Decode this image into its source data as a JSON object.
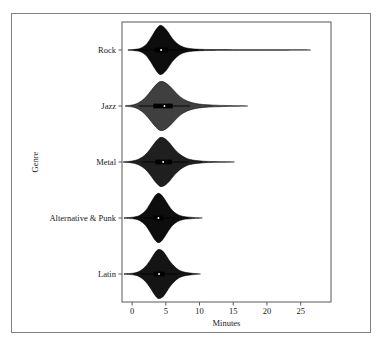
{
  "figure": {
    "background_color": "#ffffff",
    "frame_color": "#808080",
    "axis_color": "#595959"
  },
  "chart_data": {
    "type": "violin",
    "title": "",
    "subtitle": "",
    "xlabel": "Minutes",
    "ylabel": "Genre",
    "orientation": "horizontal",
    "grid": false,
    "legend": null,
    "xlim": [
      -1.5,
      29.5
    ],
    "xticks": [
      0,
      5,
      10,
      15,
      20,
      25
    ],
    "xticklabels": [
      "0",
      "5",
      "10",
      "15",
      "20",
      "25"
    ],
    "categories": [
      "Rock",
      "Jazz",
      "Metal",
      "Alternative & Punk",
      "Latin"
    ],
    "fill_colors": [
      "#0d0d0d",
      "#3f3f3f",
      "#1f1f1f",
      "#0d0d0d",
      "#141414"
    ],
    "series": [
      {
        "name": "Rock",
        "median": 4.3,
        "q1": 3.4,
        "q3": 5.3,
        "whisker_low": 0.2,
        "whisker_high": 8.0,
        "min": -0.6,
        "max": 26.1,
        "peak": 4.2,
        "peak_width": 1.0,
        "density": [
          {
            "x": -0.6,
            "d": 0.01
          },
          {
            "x": 0.5,
            "d": 0.03
          },
          {
            "x": 1.2,
            "d": 0.07
          },
          {
            "x": 2.0,
            "d": 0.2
          },
          {
            "x": 2.7,
            "d": 0.46
          },
          {
            "x": 3.3,
            "d": 0.73
          },
          {
            "x": 3.8,
            "d": 0.92
          },
          {
            "x": 4.2,
            "d": 1.0
          },
          {
            "x": 4.7,
            "d": 0.93
          },
          {
            "x": 5.3,
            "d": 0.74
          },
          {
            "x": 6.0,
            "d": 0.46
          },
          {
            "x": 6.8,
            "d": 0.24
          },
          {
            "x": 7.6,
            "d": 0.12
          },
          {
            "x": 8.6,
            "d": 0.06
          },
          {
            "x": 10.0,
            "d": 0.03
          },
          {
            "x": 12.0,
            "d": 0.02
          },
          {
            "x": 15.0,
            "d": 0.015
          },
          {
            "x": 19.0,
            "d": 0.012
          },
          {
            "x": 23.0,
            "d": 0.01
          },
          {
            "x": 26.1,
            "d": 0.005
          }
        ]
      },
      {
        "name": "Jazz",
        "median": 4.8,
        "q1": 3.2,
        "q3": 6.0,
        "whisker_low": 1.0,
        "whisker_high": 8.6,
        "min": -1.0,
        "max": 16.8,
        "peak": 4.3,
        "peak_width": 1.0,
        "density": [
          {
            "x": -1.0,
            "d": 0.01
          },
          {
            "x": 0.2,
            "d": 0.05
          },
          {
            "x": 1.0,
            "d": 0.14
          },
          {
            "x": 1.8,
            "d": 0.3
          },
          {
            "x": 2.5,
            "d": 0.52
          },
          {
            "x": 3.2,
            "d": 0.76
          },
          {
            "x": 3.8,
            "d": 0.93
          },
          {
            "x": 4.3,
            "d": 1.0
          },
          {
            "x": 4.9,
            "d": 0.95
          },
          {
            "x": 5.6,
            "d": 0.8
          },
          {
            "x": 6.4,
            "d": 0.57
          },
          {
            "x": 7.2,
            "d": 0.36
          },
          {
            "x": 8.2,
            "d": 0.2
          },
          {
            "x": 9.3,
            "d": 0.11
          },
          {
            "x": 10.6,
            "d": 0.06
          },
          {
            "x": 12.2,
            "d": 0.035
          },
          {
            "x": 14.0,
            "d": 0.02
          },
          {
            "x": 16.8,
            "d": 0.004
          }
        ]
      },
      {
        "name": "Metal",
        "median": 4.6,
        "q1": 3.5,
        "q3": 5.9,
        "whisker_low": 1.4,
        "whisker_high": 8.4,
        "min": -1.3,
        "max": 14.8,
        "peak": 4.3,
        "peak_width": 1.0,
        "density": [
          {
            "x": -1.3,
            "d": 0.01
          },
          {
            "x": 0.0,
            "d": 0.04
          },
          {
            "x": 1.0,
            "d": 0.12
          },
          {
            "x": 1.9,
            "d": 0.28
          },
          {
            "x": 2.6,
            "d": 0.5
          },
          {
            "x": 3.3,
            "d": 0.76
          },
          {
            "x": 3.9,
            "d": 0.94
          },
          {
            "x": 4.3,
            "d": 1.0
          },
          {
            "x": 4.9,
            "d": 0.94
          },
          {
            "x": 5.6,
            "d": 0.76
          },
          {
            "x": 6.3,
            "d": 0.52
          },
          {
            "x": 7.1,
            "d": 0.31
          },
          {
            "x": 8.0,
            "d": 0.16
          },
          {
            "x": 9.0,
            "d": 0.08
          },
          {
            "x": 10.3,
            "d": 0.04
          },
          {
            "x": 11.8,
            "d": 0.02
          },
          {
            "x": 14.8,
            "d": 0.004
          }
        ]
      },
      {
        "name": "Alternative & Punk",
        "median": 3.9,
        "q1": 3.2,
        "q3": 4.6,
        "whisker_low": 1.2,
        "whisker_high": 6.4,
        "min": -1.2,
        "max": 10.2,
        "peak": 3.9,
        "peak_width": 1.0,
        "density": [
          {
            "x": -1.2,
            "d": 0.01
          },
          {
            "x": 0.3,
            "d": 0.04
          },
          {
            "x": 1.2,
            "d": 0.12
          },
          {
            "x": 2.0,
            "d": 0.3
          },
          {
            "x": 2.6,
            "d": 0.55
          },
          {
            "x": 3.2,
            "d": 0.82
          },
          {
            "x": 3.6,
            "d": 0.96
          },
          {
            "x": 3.9,
            "d": 1.0
          },
          {
            "x": 4.3,
            "d": 0.95
          },
          {
            "x": 4.8,
            "d": 0.78
          },
          {
            "x": 5.4,
            "d": 0.52
          },
          {
            "x": 6.0,
            "d": 0.3
          },
          {
            "x": 6.7,
            "d": 0.15
          },
          {
            "x": 7.5,
            "d": 0.07
          },
          {
            "x": 8.5,
            "d": 0.035
          },
          {
            "x": 10.2,
            "d": 0.004
          }
        ]
      },
      {
        "name": "Latin",
        "median": 4.0,
        "q1": 3.3,
        "q3": 4.8,
        "whisker_low": 1.3,
        "whisker_high": 6.7,
        "min": -1.2,
        "max": 10.0,
        "peak": 4.0,
        "peak_width": 1.0,
        "density": [
          {
            "x": -1.2,
            "d": 0.01
          },
          {
            "x": 0.3,
            "d": 0.04
          },
          {
            "x": 1.2,
            "d": 0.13
          },
          {
            "x": 2.0,
            "d": 0.31
          },
          {
            "x": 2.7,
            "d": 0.57
          },
          {
            "x": 3.3,
            "d": 0.83
          },
          {
            "x": 3.7,
            "d": 0.96
          },
          {
            "x": 4.0,
            "d": 1.0
          },
          {
            "x": 4.5,
            "d": 0.94
          },
          {
            "x": 5.0,
            "d": 0.77
          },
          {
            "x": 5.6,
            "d": 0.52
          },
          {
            "x": 6.3,
            "d": 0.3
          },
          {
            "x": 7.0,
            "d": 0.15
          },
          {
            "x": 7.9,
            "d": 0.07
          },
          {
            "x": 8.9,
            "d": 0.03
          },
          {
            "x": 10.0,
            "d": 0.004
          }
        ]
      }
    ]
  }
}
